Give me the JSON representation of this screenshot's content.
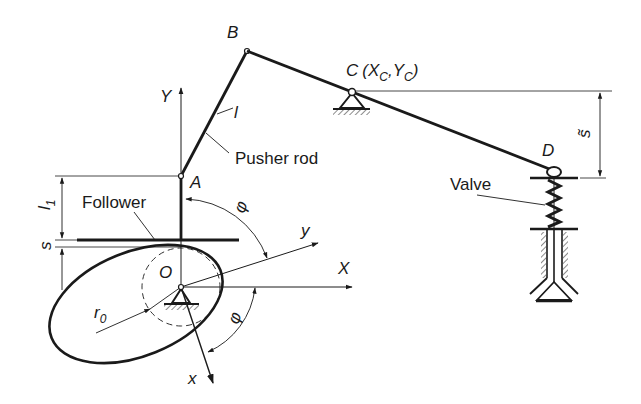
{
  "diagram": {
    "type": "cam-rocker-valve mechanism",
    "points": {
      "A": "A",
      "B": "B",
      "C": "C",
      "C_coords_open": "(",
      "C_X": "X",
      "C_X_sub": "C",
      "C_comma": ",",
      "C_Y": "Y",
      "C_Y_sub": "C",
      "C_coords_close": ")",
      "D": "D",
      "O": "O"
    },
    "axes": {
      "X": "X",
      "Y": "Y",
      "x": "x",
      "y": "y"
    },
    "dimensions": {
      "l": "l",
      "l1": "l",
      "l1_sub": "1",
      "s": "s",
      "s_tilde": "s̃",
      "r0": "r",
      "r0_sub": "0",
      "phi_top": "φ",
      "phi_bottom": "φ"
    },
    "callouts": {
      "pusher_rod": "Pusher rod",
      "follower": "Follower",
      "valve": "Valve"
    },
    "colors": {
      "ink": "#1a1a1a",
      "background": "#ffffff"
    }
  }
}
